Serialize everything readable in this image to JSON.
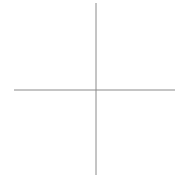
{
  "diagram": {
    "type": "crosshair-axes",
    "background": "#ffffff",
    "line_color": "#8a8a8a",
    "vertical_axis": {
      "x": 96,
      "y1": 3,
      "y2": 175
    },
    "horizontal_axis": {
      "y": 90,
      "x1": 14,
      "x2": 175
    }
  }
}
